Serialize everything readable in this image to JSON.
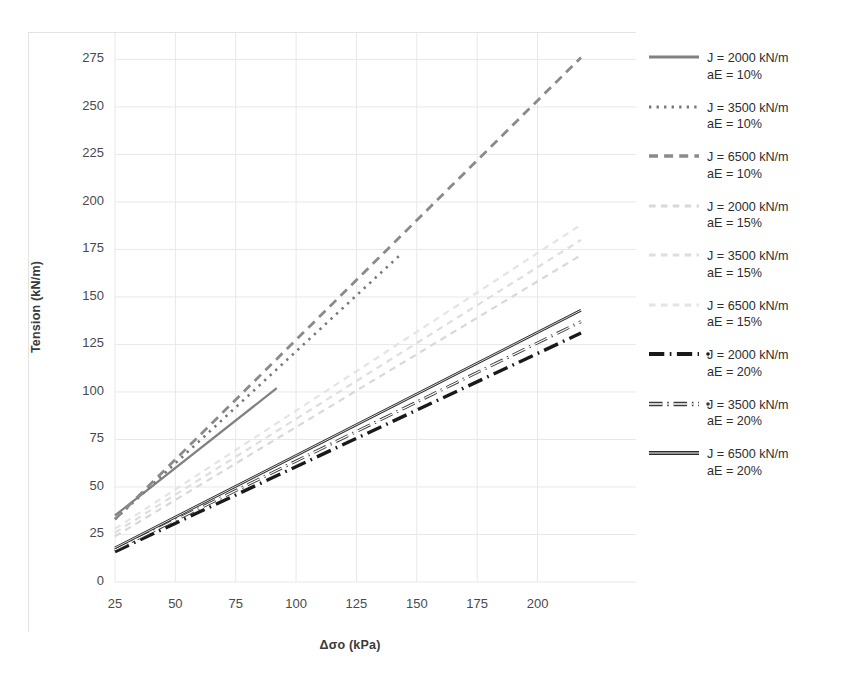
{
  "chart_data": {
    "type": "line",
    "title": "",
    "xlabel": "Δσo (kPa)",
    "ylabel": "Tension (kN/m)",
    "xlim": [
      25,
      218
    ],
    "ylim": [
      0,
      281
    ],
    "xticks": [
      25,
      50,
      75,
      100,
      125,
      150,
      175,
      200
    ],
    "yticks": [
      0,
      25,
      50,
      75,
      100,
      125,
      150,
      175,
      200,
      225,
      250,
      275
    ],
    "grid": true,
    "legend_position": "right",
    "series": [
      {
        "name": "J = 2000 kN/m\naE = 10%",
        "label_line1": "J = 2000 kN/m",
        "label_line2": "aE = 10%",
        "style": "solid",
        "color": "#808080",
        "width": 2.2,
        "x": [
          25,
          92
        ],
        "y": [
          35,
          102
        ]
      },
      {
        "name": "J = 3500 kN/m\naE = 10%",
        "label_line1": "J = 3500 kN/m",
        "label_line2": "aE = 10%",
        "style": "dotted",
        "color": "#777777",
        "width": 2.6,
        "x": [
          25,
          143
        ],
        "y": [
          33,
          172
        ]
      },
      {
        "name": "J = 6500 kN/m\naE = 10%",
        "label_line1": "J = 6500 kN/m",
        "label_line2": "aE = 10%",
        "style": "dashed",
        "color": "#8a8a8a",
        "width": 2.8,
        "x": [
          25,
          218
        ],
        "y": [
          33,
          276
        ]
      },
      {
        "name": "J = 2000 kN/m\naE = 15%",
        "label_line1": "J = 2000 kN/m",
        "label_line2": "aE = 15%",
        "style": "dashed-light",
        "color": "#d8d8d8",
        "width": 2.2,
        "x": [
          25,
          218
        ],
        "y": [
          24,
          172
        ]
      },
      {
        "name": "J = 3500 kN/m\naE = 15%",
        "label_line1": "J = 3500 kN/m",
        "label_line2": "aE = 15%",
        "style": "dashed-light",
        "color": "#dedede",
        "width": 2.2,
        "x": [
          25,
          218
        ],
        "y": [
          26,
          180
        ]
      },
      {
        "name": "J = 6500 kN/m\naE = 15%",
        "label_line1": "J = 6500 kN/m",
        "label_line2": "aE = 15%",
        "style": "dashed-light",
        "color": "#e4e4e4",
        "width": 2.2,
        "x": [
          25,
          218
        ],
        "y": [
          28,
          188
        ]
      },
      {
        "name": "J = 2000 kN/m\naE = 20%",
        "label_line1": "J = 2000 kN/m",
        "label_line2": "aE = 20%",
        "style": "dash-dot-thick",
        "color": "#1a1a1a",
        "width": 3.4,
        "x": [
          25,
          218
        ],
        "y": [
          16,
          131
        ]
      },
      {
        "name": "J = 3500 kN/m\naE = 20%",
        "label_line1": "J = 3500 kN/m",
        "label_line2": "aE = 20%",
        "style": "dash-dot-hollow",
        "color": "#3c3c3c",
        "width": 3.0,
        "x": [
          25,
          218
        ],
        "y": [
          17,
          137
        ]
      },
      {
        "name": "J = 6500 kN/m\naE = 20%",
        "label_line1": "J = 6500 kN/m",
        "label_line2": "aE = 20%",
        "style": "solid-hollow",
        "color": "#2b2b2b",
        "width": 2.6,
        "x": [
          25,
          218
        ],
        "y": [
          18,
          143
        ]
      }
    ]
  },
  "axes": {
    "xlabel": "Δσo (kPa)",
    "ylabel": "Tension (kN/m)",
    "xticklabels": [
      "25",
      "50",
      "75",
      "100",
      "125",
      "150",
      "175",
      "200"
    ],
    "yticklabels": [
      "0",
      "25",
      "50",
      "75",
      "100",
      "125",
      "150",
      "175",
      "200",
      "225",
      "250",
      "275"
    ]
  },
  "legend": {
    "items": [
      {
        "line1": "J = 2000 kN/m",
        "line2": "aE = 10%"
      },
      {
        "line1": "J = 3500 kN/m",
        "line2": "aE = 10%"
      },
      {
        "line1": "J = 6500 kN/m",
        "line2": "aE = 10%"
      },
      {
        "line1": "J = 2000 kN/m",
        "line2": "aE = 15%"
      },
      {
        "line1": "J = 3500 kN/m",
        "line2": "aE = 15%"
      },
      {
        "line1": "J = 6500 kN/m",
        "line2": "aE = 15%"
      },
      {
        "line1": "J = 2000 kN/m",
        "line2": "aE = 20%"
      },
      {
        "line1": "J = 3500 kN/m",
        "line2": "aE = 20%"
      },
      {
        "line1": "J = 6500 kN/m",
        "line2": "aE = 20%"
      }
    ]
  },
  "colors": {
    "grid": "#e8e8e8",
    "text": "#3a3a3a",
    "background": "#ffffff"
  }
}
